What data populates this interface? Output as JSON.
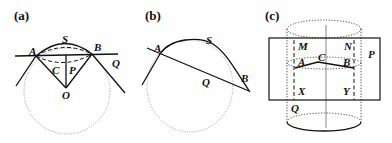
{
  "panels": [
    {
      "id": "a",
      "label": "(a)",
      "points": {
        "A": "A",
        "B": "B",
        "S": "S",
        "Q": "Q",
        "C": "C",
        "P": "P",
        "O": "O"
      }
    },
    {
      "id": "b",
      "label": "(b)",
      "points": {
        "A": "A",
        "S": "S",
        "Q": "Q",
        "B": "B"
      }
    },
    {
      "id": "c",
      "label": "(c)",
      "points": {
        "M": "M",
        "N": "N",
        "P": "P",
        "A": "A",
        "C": "C",
        "B": "B",
        "X": "X",
        "Y": "Y",
        "Q": "Q"
      }
    }
  ],
  "colors": {
    "stroke": "#111111",
    "circle": "#888888",
    "background": "#ffffff"
  }
}
